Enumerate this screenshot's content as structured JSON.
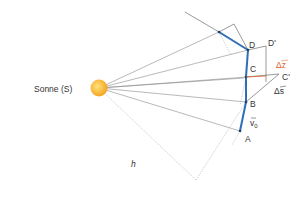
{
  "sun": {
    "label": "Sonne  (S)",
    "color_outer": "#f5a623",
    "color_inner": "#fcd45a"
  },
  "points": {
    "A": "A",
    "B": "B",
    "C": "C",
    "D": "D",
    "C_prime": "C'",
    "D_prime": "D'"
  },
  "vectors": {
    "v0": "v",
    "v0_sub": "0",
    "delta_s": "Δs",
    "delta_z": "Δz"
  },
  "distance_label": "h",
  "colors": {
    "orbit_path": "#2e6fb7",
    "delta_z": "#e0632a",
    "rays": "#8a8a8a",
    "construction": "#aaaaaa"
  }
}
